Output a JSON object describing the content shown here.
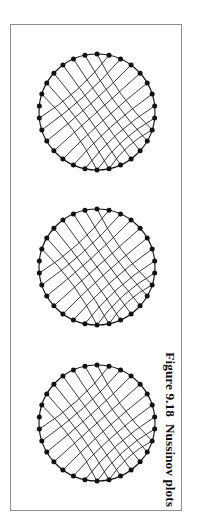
{
  "page": {
    "background_color": "#ffffff",
    "width": 210,
    "height": 521
  },
  "figure": {
    "border_color": "#8e8e8e",
    "panel_background": "#ffffff",
    "caption_number": "Figure 9.18",
    "caption_text": "Nussinov plots",
    "caption_rotation_deg": 90,
    "node_color": "#111111",
    "arc_color": "#1a1a1a",
    "circle_color": "#111111"
  },
  "chart_data": {
    "type": "diagram",
    "title": "Figure 9.18  Nussinov plots",
    "subtype": "nussinov-circle-plot",
    "panel_rotation_deg": 90,
    "plots": [
      {
        "id": "plot-1",
        "label": "top",
        "center_x": 86,
        "center_y": 87,
        "radius": 58,
        "node_count": 30,
        "node_radius": 2.5,
        "start_angle_deg": -90,
        "arc_count": 16,
        "arc_families": [
          {
            "name": "outer-nested-fan",
            "pairs": 9
          },
          {
            "name": "inner-crossing-fan",
            "pairs": 7
          }
        ]
      },
      {
        "id": "plot-2",
        "label": "middle",
        "center_x": 86,
        "center_y": 242,
        "radius": 58,
        "node_count": 30,
        "node_radius": 2.5,
        "start_angle_deg": -90,
        "arc_count": 16,
        "arc_families": [
          {
            "name": "outer-nested-fan",
            "pairs": 9
          },
          {
            "name": "inner-crossing-fan",
            "pairs": 7
          }
        ]
      },
      {
        "id": "plot-3",
        "label": "bottom",
        "center_x": 86,
        "center_y": 398,
        "radius": 58,
        "node_count": 30,
        "node_radius": 2.5,
        "start_angle_deg": -90,
        "arc_count": 16,
        "arc_families": [
          {
            "name": "outer-nested-fan",
            "pairs": 9
          },
          {
            "name": "inner-crossing-fan",
            "pairs": 7
          }
        ]
      }
    ],
    "base_pairs": [
      [
        1,
        22
      ],
      [
        2,
        21
      ],
      [
        3,
        20
      ],
      [
        4,
        19
      ],
      [
        5,
        18
      ],
      [
        6,
        17
      ],
      [
        7,
        16
      ],
      [
        8,
        15
      ],
      [
        9,
        14
      ],
      [
        27,
        12
      ],
      [
        28,
        11
      ],
      [
        29,
        10
      ],
      [
        0,
        9
      ],
      [
        26,
        13
      ],
      [
        25,
        14
      ],
      [
        24,
        15
      ]
    ],
    "xlabel": "",
    "ylabel": "",
    "grid": false,
    "legend": false
  }
}
